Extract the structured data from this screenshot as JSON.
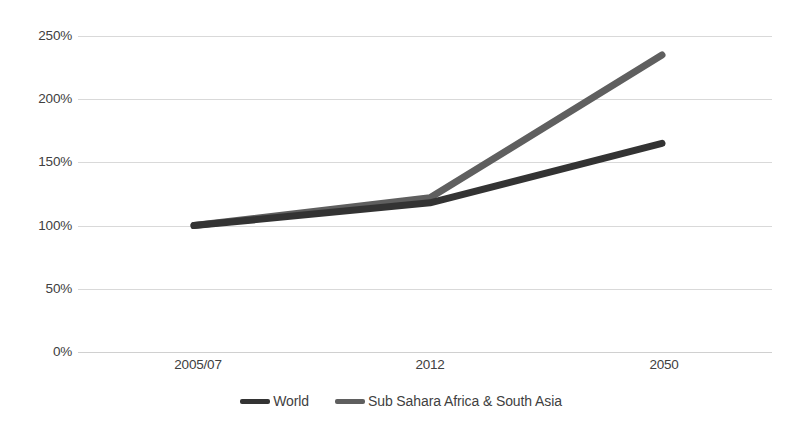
{
  "chart_data": {
    "type": "line",
    "title": "",
    "subtitle": "",
    "xlabel": "",
    "ylabel": "",
    "categories": [
      "2005/07",
      "2012",
      "2050"
    ],
    "series": [
      {
        "name": "World",
        "values": [
          100,
          118,
          165
        ],
        "color": "#333333"
      },
      {
        "name": "Sub Sahara Africa & South Asia",
        "values": [
          100,
          122,
          235
        ],
        "color": "#5f5f5f"
      }
    ],
    "ylim": [
      0,
      250
    ],
    "ytick_values": [
      0,
      50,
      100,
      150,
      200,
      250
    ],
    "ytick_labels": [
      "0%",
      "50%",
      "100%",
      "150%",
      "200%",
      "250%"
    ],
    "yunit": "%",
    "grid": true,
    "grid_axis": "y",
    "grid_color": "#d9d9d9",
    "legend_position": "bottom",
    "background": "#ffffff"
  },
  "legend": {
    "items": [
      {
        "label": "World",
        "color": "#333333"
      },
      {
        "label": "Sub Sahara Africa & South Asia",
        "color": "#5f5f5f"
      }
    ]
  }
}
